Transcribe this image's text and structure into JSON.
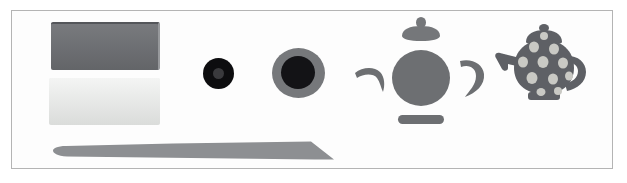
{
  "canvas": {
    "width": 627,
    "height": 183,
    "background_color": "#ffffff",
    "frame_color": "#b4b4b4"
  },
  "objects": [
    {
      "name": "dark-block",
      "label": "Dark slate rectangular block",
      "color": "#6e7074",
      "edge_color": "#54565a"
    },
    {
      "name": "light-block",
      "label": "Pale grey rectangular block",
      "color": "#e6e8e6"
    },
    {
      "name": "tapered-blade",
      "label": "Long tapered blade",
      "color": "#8d8f92"
    },
    {
      "name": "small-disc",
      "label": "Small dark disc",
      "color": "#0d0d0f",
      "center_color": "#3a3a3d"
    },
    {
      "name": "large-disc",
      "label": "Large ringed disc",
      "color": "#76787b",
      "center_color": "#131316"
    },
    {
      "name": "teapot-exploded",
      "label": "Exploded teapot parts",
      "color": "#6d6f72",
      "parts": [
        "lid",
        "body",
        "spout",
        "handle",
        "base"
      ]
    },
    {
      "name": "teapot-assembled",
      "label": "Polka dot teapot",
      "color": "#5e6065",
      "dot_color": "#c9c9c4"
    }
  ]
}
